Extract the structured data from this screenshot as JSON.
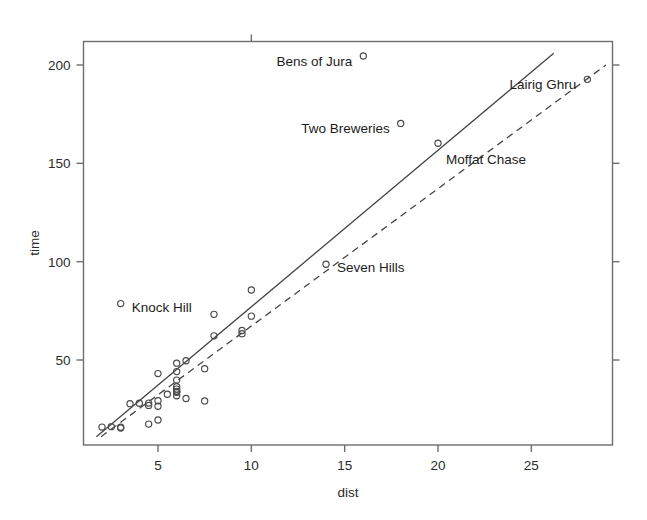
{
  "chart_data": {
    "type": "scatter",
    "title": "",
    "xlabel": "dist",
    "ylabel": "time",
    "xlim": [
      1.5,
      29.0
    ],
    "ylim": [
      11.0,
      206.0
    ],
    "grid": false,
    "legend": null,
    "xticks": [
      5,
      10,
      15,
      20,
      25
    ],
    "yticks": [
      50,
      100,
      150,
      200
    ],
    "xtick_labels": [
      "5",
      "10",
      "15",
      "20",
      "25"
    ],
    "ytick_labels": [
      "50",
      "100",
      "150",
      "200"
    ],
    "marker": "open-circle",
    "points": [
      {
        "x": 2.5,
        "y": 16.1
      },
      {
        "x": 6.0,
        "y": 48.4
      },
      {
        "x": 6.0,
        "y": 33.6
      },
      {
        "x": 7.5,
        "y": 45.6
      },
      {
        "x": 8.0,
        "y": 62.3
      },
      {
        "x": 8.0,
        "y": 73.2
      },
      {
        "x": 16.0,
        "y": 204.6
      },
      {
        "x": 6.0,
        "y": 36.4
      },
      {
        "x": 5.0,
        "y": 29.3
      },
      {
        "x": 6.0,
        "y": 39.8
      },
      {
        "x": 28.0,
        "y": 192.7
      },
      {
        "x": 5.0,
        "y": 43.1
      },
      {
        "x": 9.5,
        "y": 65.0
      },
      {
        "x": 6.0,
        "y": 44.1
      },
      {
        "x": 4.5,
        "y": 26.9
      },
      {
        "x": 10.0,
        "y": 72.3
      },
      {
        "x": 14.0,
        "y": 98.7
      },
      {
        "x": 3.0,
        "y": 78.7
      },
      {
        "x": 4.5,
        "y": 17.4
      },
      {
        "x": 5.5,
        "y": 32.6
      },
      {
        "x": 3.0,
        "y": 15.4
      },
      {
        "x": 3.5,
        "y": 27.8
      },
      {
        "x": 6.0,
        "y": 34.0
      },
      {
        "x": 2.0,
        "y": 15.9
      },
      {
        "x": 3.0,
        "y": 15.8
      },
      {
        "x": 4.0,
        "y": 28.0
      },
      {
        "x": 6.0,
        "y": 35.2
      },
      {
        "x": 5.0,
        "y": 19.5
      },
      {
        "x": 6.5,
        "y": 49.6
      },
      {
        "x": 20.0,
        "y": 160.2
      },
      {
        "x": 5.0,
        "y": 26.5
      },
      {
        "x": 6.5,
        "y": 30.4
      },
      {
        "x": 7.5,
        "y": 29.2
      },
      {
        "x": 10.0,
        "y": 85.6
      },
      {
        "x": 6.0,
        "y": 31.8
      },
      {
        "x": 18.0,
        "y": 170.3
      },
      {
        "x": 4.5,
        "y": 28.1
      },
      {
        "x": 6.0,
        "y": 33.8
      },
      {
        "x": 9.5,
        "y": 63.4
      }
    ],
    "annotations": [
      {
        "text": "Bens of Jura",
        "point": {
          "x": 16.0,
          "y": 204.6
        },
        "side": "left"
      },
      {
        "text": "Lairig Ghru",
        "point": {
          "x": 28.0,
          "y": 192.7
        },
        "side": "left"
      },
      {
        "text": "Two Breweries",
        "point": {
          "x": 18.0,
          "y": 170.3
        },
        "side": "left"
      },
      {
        "text": "Moffat Chase",
        "point": {
          "x": 20.0,
          "y": 160.2
        },
        "side": "below-right"
      },
      {
        "text": "Seven Hills",
        "point": {
          "x": 14.0,
          "y": 98.7
        },
        "side": "right"
      },
      {
        "text": "Knock Hill",
        "point": {
          "x": 3.0,
          "y": 78.7
        },
        "side": "right"
      }
    ],
    "lines": [
      {
        "name": "least-squares fit",
        "style": "solid",
        "p1": {
          "x": 1.7,
          "y": 11.0
        },
        "p2": {
          "x": 26.2,
          "y": 206.0
        }
      },
      {
        "name": "robust/resistant fit",
        "style": "dashed",
        "p1": {
          "x": 1.95,
          "y": 11.0
        },
        "p2": {
          "x": 29.0,
          "y": 200.0
        }
      }
    ],
    "colors": {
      "marker_stroke": "#4a4a4a",
      "line": "#444444",
      "frame": "#6d6d6d",
      "text": "#2b2b2b",
      "background": "#ffffff"
    }
  },
  "axes": {
    "x_axis_label": "dist",
    "y_axis_label": "time"
  }
}
